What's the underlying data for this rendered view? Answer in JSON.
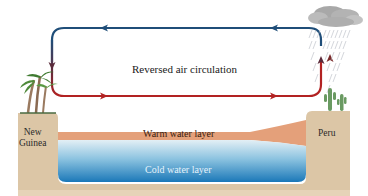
{
  "diagram": {
    "title": "Reversed air circulation",
    "labels": {
      "warm_layer": "Warm water layer",
      "cold_layer": "Cold water layer",
      "left_land_line1": "New",
      "left_land_line2": "Guinea",
      "right_land": "Peru"
    },
    "colors": {
      "upper_arrow": "#1f4e79",
      "lower_arrow": "#b22222",
      "land": "#d9c2a3",
      "warm_water": "#e4a07a",
      "cold_water_top": "#cfe6f2",
      "cold_water_bottom": "#1f7fbf",
      "cloud": "#9e9e9e",
      "vegetation": "#4a8a3a"
    },
    "icons": [
      "palm-trees-icon",
      "cactus-icon",
      "storm-cloud-icon",
      "rain-icon"
    ]
  }
}
